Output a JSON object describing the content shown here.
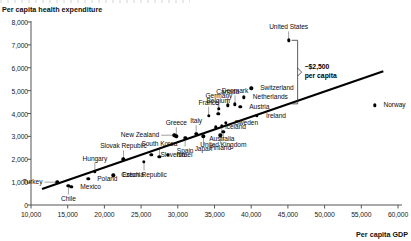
{
  "axis_titles": {
    "y": "Per capita health expenditure",
    "x": "Per capita GDP"
  },
  "annotation": {
    "line1": "~$2,500",
    "line2": "per capita"
  },
  "chart_data": {
    "type": "scatter",
    "title": "",
    "xlabel": "Per capita GDP",
    "ylabel": "Per capita health expenditure",
    "xlim": [
      10000,
      60000
    ],
    "ylim": [
      0,
      8000
    ],
    "xticks": [
      "10,000",
      "15,000",
      "20,000",
      "25,000",
      "30,000",
      "35,000",
      "40,000",
      "45,000",
      "50,000",
      "55,000",
      "60,000"
    ],
    "xtick_values": [
      10000,
      15000,
      20000,
      25000,
      30000,
      35000,
      40000,
      45000,
      50000,
      55000,
      60000
    ],
    "yticks": [
      "0",
      "1,000",
      "2,000",
      "3,000",
      "4,000",
      "5,000",
      "6,000",
      "7,000",
      "8,000"
    ],
    "ytick_values": [
      0,
      1000,
      2000,
      3000,
      4000,
      5000,
      6000,
      7000,
      8000
    ],
    "grid": false,
    "legend": false,
    "annotations": [
      {
        "text": "~$2,500 per capita",
        "meaning": "vertical gap between United States and the fitted trend line"
      }
    ],
    "trendline": {
      "x": [
        11500,
        58000
      ],
      "y": [
        700,
        5850
      ]
    },
    "points": [
      {
        "name": "Turkey",
        "x": 13600,
        "y": 1000,
        "label_pos": "left"
      },
      {
        "name": "Chile",
        "x": 15100,
        "y": 850,
        "label_pos": "below"
      },
      {
        "name": "Mexico",
        "x": 15500,
        "y": 790,
        "label_pos": "right"
      },
      {
        "name": "Poland",
        "x": 17800,
        "y": 1150,
        "label_pos": "right"
      },
      {
        "name": "Hungary",
        "x": 18700,
        "y": 1450,
        "label_pos": "above"
      },
      {
        "name": "Estonia",
        "x": 21200,
        "y": 1300,
        "label_pos": "right"
      },
      {
        "name": "Slovak Republic",
        "x": 22600,
        "y": 2000,
        "label_pos": "above"
      },
      {
        "name": "Czech Republic",
        "x": 25400,
        "y": 1900,
        "label_pos": "below"
      },
      {
        "name": "Slovenia",
        "x": 26400,
        "y": 2200,
        "label_pos": "right"
      },
      {
        "name": "South Korea",
        "x": 27500,
        "y": 2100,
        "label_pos": "above"
      },
      {
        "name": "Israel",
        "x": 28600,
        "y": 2200,
        "label_pos": "right"
      },
      {
        "name": "New Zealand",
        "x": 29500,
        "y": 3050,
        "label_pos": "left"
      },
      {
        "name": "Greece",
        "x": 29800,
        "y": 3000,
        "label_pos": "above"
      },
      {
        "name": "Spain",
        "x": 31000,
        "y": 2950,
        "label_pos": "below"
      },
      {
        "name": "Italy",
        "x": 32500,
        "y": 3100,
        "label_pos": "above"
      },
      {
        "name": "Japan",
        "x": 33500,
        "y": 3000,
        "label_pos": "below"
      },
      {
        "name": "Finland",
        "x": 35800,
        "y": 3050,
        "label_pos": "below"
      },
      {
        "name": "United Kingdom",
        "x": 36200,
        "y": 3200,
        "label_pos": "below"
      },
      {
        "name": "Australia",
        "x": 36000,
        "y": 3450,
        "label_pos": "below"
      },
      {
        "name": "France",
        "x": 34200,
        "y": 3900,
        "label_pos": "above"
      },
      {
        "name": "Germany",
        "x": 35600,
        "y": 4200,
        "label_pos": "above"
      },
      {
        "name": "Belgium",
        "x": 35500,
        "y": 4000,
        "label_pos": "above"
      },
      {
        "name": "Iceland",
        "x": 35200,
        "y": 3400,
        "label_pos": "right"
      },
      {
        "name": "Sweden",
        "x": 36500,
        "y": 3600,
        "label_pos": "right"
      },
      {
        "name": "Canada",
        "x": 36800,
        "y": 4350,
        "label_pos": "above"
      },
      {
        "name": "Denmark",
        "x": 37800,
        "y": 4400,
        "label_pos": "above"
      },
      {
        "name": "Austria",
        "x": 38500,
        "y": 4300,
        "label_pos": "right"
      },
      {
        "name": "Netherlands",
        "x": 39000,
        "y": 4700,
        "label_pos": "right"
      },
      {
        "name": "Ireland",
        "x": 40800,
        "y": 3900,
        "label_pos": "right"
      },
      {
        "name": "Switzerland",
        "x": 40000,
        "y": 5100,
        "label_pos": "right"
      },
      {
        "name": "United States",
        "x": 45100,
        "y": 7200,
        "label_pos": "above"
      },
      {
        "name": "Norway",
        "x": 56800,
        "y": 4350,
        "label_pos": "right"
      }
    ]
  }
}
